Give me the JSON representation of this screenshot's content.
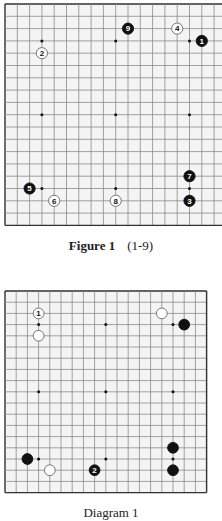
{
  "figure1": {
    "caption_label": "Figure 1",
    "caption_range": "(1-9)",
    "board_size": 19,
    "origin": [
      5,
      4
    ],
    "spacing": 12.3,
    "star_points": [
      3,
      9,
      15
    ],
    "stones": [
      {
        "color": "black",
        "col": 16,
        "row": 3,
        "label": "1"
      },
      {
        "color": "white",
        "col": 3,
        "row": 4,
        "label": "2"
      },
      {
        "color": "black",
        "col": 15,
        "row": 16,
        "label": "3"
      },
      {
        "color": "white",
        "col": 14,
        "row": 2,
        "label": "4"
      },
      {
        "color": "black",
        "col": 2,
        "row": 15,
        "label": "5"
      },
      {
        "color": "white",
        "col": 4,
        "row": 16,
        "label": "6"
      },
      {
        "color": "black",
        "col": 15,
        "row": 14,
        "label": "7"
      },
      {
        "color": "white",
        "col": 9,
        "row": 16,
        "label": "8"
      },
      {
        "color": "black",
        "col": 10,
        "row": 2,
        "label": "9"
      }
    ]
  },
  "diagram1": {
    "caption_label": "Diagram 1",
    "board_size": 19,
    "origin": [
      5,
      291
    ],
    "spacing": 11.2,
    "star_points": [
      3,
      9,
      15
    ],
    "stones": [
      {
        "color": "white",
        "col": 3,
        "row": 2,
        "label": "1"
      },
      {
        "color": "white",
        "col": 3,
        "row": 4,
        "label": ""
      },
      {
        "color": "white",
        "col": 14,
        "row": 2,
        "label": ""
      },
      {
        "color": "black",
        "col": 16,
        "row": 3,
        "label": ""
      },
      {
        "color": "black",
        "col": 2,
        "row": 15,
        "label": ""
      },
      {
        "color": "white",
        "col": 4,
        "row": 16,
        "label": ""
      },
      {
        "color": "black",
        "col": 8,
        "row": 16,
        "label": "2"
      },
      {
        "color": "black",
        "col": 15,
        "row": 14,
        "label": ""
      },
      {
        "color": "black",
        "col": 15,
        "row": 16,
        "label": ""
      }
    ]
  },
  "colors": {
    "grid": "#8a8a8a",
    "border": "#333333",
    "board_bg": "#f4f4f4",
    "black_stone": "#111111",
    "white_stone": "#ffffff"
  }
}
